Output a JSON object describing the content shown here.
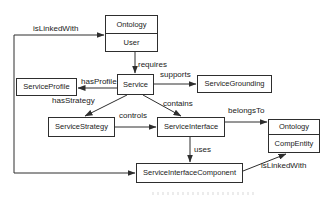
{
  "diagram": {
    "nodes": {
      "ontology_user": {
        "title": "Ontology",
        "subtitle": "User"
      },
      "service_profile": {
        "label": "ServiceProfile"
      },
      "service": {
        "label": "Service"
      },
      "service_grounding": {
        "label": "ServiceGrounding"
      },
      "service_strategy": {
        "label": "ServiceStrategy"
      },
      "service_interface": {
        "label": "ServiceInterface"
      },
      "ontology_compentity": {
        "title": "Ontology",
        "subtitle": "CompEntity"
      },
      "service_interface_component": {
        "label": "ServiceInterfaceComponent"
      }
    },
    "edges": {
      "is_linked_with_top": {
        "label": "isLinkedWith"
      },
      "requires": {
        "label": "requires"
      },
      "has_profile": {
        "label": "hasProfile"
      },
      "supports": {
        "label": "supports"
      },
      "has_strategy": {
        "label": "hasStrategy"
      },
      "contains": {
        "label": "contains"
      },
      "controls": {
        "label": "controls"
      },
      "belongs_to": {
        "label": "belongsTo"
      },
      "uses": {
        "label": "uses"
      },
      "is_linked_with_bottom": {
        "label": "isLinkedWith"
      }
    },
    "colors": {
      "line": "#2e2e2e",
      "text": "#222222",
      "box_fill": "#ffffff",
      "background": "#ffffff"
    }
  }
}
